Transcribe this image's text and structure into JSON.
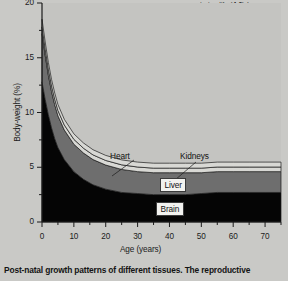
{
  "figure": {
    "caption": "Post-natal growth patterns of different tissues. The reproductive",
    "body_text_lines": [
      "uterine life (4.6) (ne",
      "trimester, but glial c",
      "inantly in the third t",
      "birth. Most of its ad"
    ],
    "body_text_bold_fragment": "4.6"
  },
  "chart_data": {
    "type": "area",
    "title": "",
    "xlabel": "Age (years)",
    "ylabel": "Body-weight (%)",
    "xlim": [
      0,
      75
    ],
    "ylim": [
      0,
      20
    ],
    "grid": false,
    "legend_position": "in-plot-labels",
    "x_ticks": [
      0,
      10,
      20,
      30,
      40,
      50,
      60,
      70
    ],
    "x_tick_labels": [
      "0",
      "10",
      "20",
      "30",
      "40",
      "50",
      "60",
      "70"
    ],
    "x_minor_tick_step": 5,
    "y_ticks": [
      0,
      5,
      10,
      15,
      20
    ],
    "y_tick_labels": [
      "0",
      "5",
      "10",
      "15",
      "20"
    ],
    "y_minor_tick_step": 2.5,
    "x": [
      0,
      1,
      2,
      3,
      4,
      5,
      7,
      10,
      13,
      16,
      20,
      25,
      30,
      35,
      40,
      45,
      50,
      55,
      60,
      65,
      70,
      75
    ],
    "stacked": true,
    "series": [
      {
        "name": "Brain",
        "color": "#050505",
        "label_style": "boxed",
        "values": [
          12.8,
          11.2,
          9.8,
          8.6,
          7.6,
          6.8,
          5.7,
          4.6,
          3.9,
          3.4,
          3.0,
          2.7,
          2.6,
          2.5,
          2.5,
          2.5,
          2.6,
          2.7,
          2.7,
          2.7,
          2.7,
          2.7
        ]
      },
      {
        "name": "Liver",
        "color": "#6e6e6e",
        "label_style": "boxed",
        "values": [
          4.4,
          4.0,
          3.6,
          3.3,
          3.1,
          2.9,
          2.7,
          2.5,
          2.4,
          2.3,
          2.2,
          2.1,
          2.0,
          2.0,
          2.0,
          2.0,
          1.9,
          1.9,
          1.9,
          1.9,
          1.9,
          1.9
        ]
      },
      {
        "name": "Kidneys",
        "color": "#d8d8d4",
        "label_style": "leader-line",
        "values": [
          0.62,
          0.58,
          0.55,
          0.52,
          0.5,
          0.48,
          0.46,
          0.45,
          0.44,
          0.43,
          0.42,
          0.42,
          0.42,
          0.42,
          0.42,
          0.42,
          0.42,
          0.42,
          0.42,
          0.42,
          0.42,
          0.42
        ]
      },
      {
        "name": "Heart",
        "color": "#d8d8d4",
        "label_style": "leader-line",
        "values": [
          0.7,
          0.66,
          0.62,
          0.59,
          0.57,
          0.55,
          0.52,
          0.5,
          0.48,
          0.47,
          0.46,
          0.45,
          0.45,
          0.45,
          0.45,
          0.45,
          0.45,
          0.45,
          0.45,
          0.45,
          0.45,
          0.45
        ]
      }
    ],
    "series_labels": [
      {
        "name": "Heart",
        "text": "Heart"
      },
      {
        "name": "Kidneys",
        "text": "Kidneys"
      },
      {
        "name": "Liver",
        "text": "Liver"
      },
      {
        "name": "Brain",
        "text": "Brain"
      }
    ],
    "plot_background": "#c4c4c1",
    "axis_color": "#1b1b1b"
  }
}
